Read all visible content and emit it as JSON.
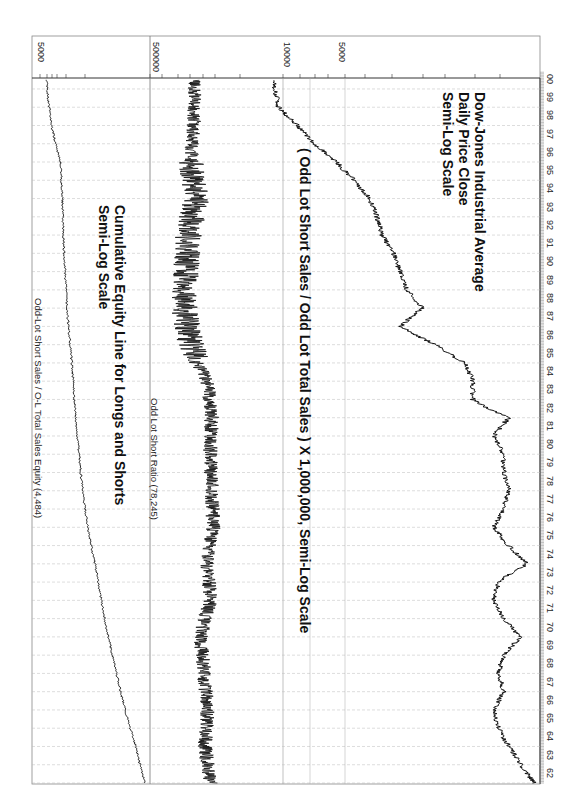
{
  "chart_data": [
    {
      "type": "line",
      "title": "Odd-Lot Short Sales / O-L Total Sales Equity (4,484)",
      "annotation": [
        "Cumulative Equity Line for Longs and Shorts",
        "Semi-Log Scale"
      ],
      "orientation": "rotated 90deg clockwise (time runs bottom-to-top)",
      "scale": "log",
      "tick_labels": [
        "5000"
      ],
      "x": [
        1962,
        1964,
        1966,
        1968,
        1970,
        1972,
        1974,
        1976,
        1978,
        1980,
        1982,
        1984,
        1986,
        1988,
        1990,
        1992,
        1994,
        1996,
        1998,
        2000
      ],
      "values": [
        1000,
        1150,
        1350,
        1550,
        1750,
        1950,
        2150,
        2400,
        2600,
        2750,
        2900,
        3000,
        3150,
        3300,
        3400,
        3500,
        3550,
        3650,
        4200,
        4484
      ],
      "grid": true
    },
    {
      "type": "line",
      "title": "Odd Lot Short Ratio (78,245)",
      "annotation": [
        "( Odd Lot Short Sales / Odd Lot Total Sales ) X 1,000,000, Semi-Log Scale"
      ],
      "scale": "log",
      "tick_labels": [
        "500000"
      ],
      "x": [
        1962,
        1964,
        1966,
        1968,
        1970,
        1972,
        1974,
        1976,
        1978,
        1980,
        1982,
        1984,
        1986,
        1988,
        1990,
        1992,
        1994,
        1996,
        1998,
        2000
      ],
      "values": [
        40000,
        50000,
        45000,
        52000,
        60000,
        40000,
        45000,
        35000,
        38000,
        40000,
        38000,
        45000,
        90000,
        120000,
        110000,
        100000,
        70000,
        90000,
        80000,
        78245
      ],
      "grid": true
    },
    {
      "type": "line",
      "title": "Dow-Jones Industrial Average",
      "annotation": [
        "Dow-Jones Industrial Average",
        "Daily Price Close",
        "Semi-Log Scale"
      ],
      "scale": "log",
      "tick_labels": [
        "10000",
        "5000"
      ],
      "x": [
        1962,
        1963,
        1964,
        1965,
        1966,
        1967,
        1968,
        1969,
        1970,
        1971,
        1972,
        1973,
        1974,
        1975,
        1976,
        1977,
        1978,
        1979,
        1980,
        1981,
        1982,
        1983,
        1984,
        1985,
        1986,
        1987,
        1988,
        1989,
        1990,
        1991,
        1992,
        1993,
        1994,
        1995,
        1996,
        1997,
        1998,
        1999,
        2000
      ],
      "values": [
        600,
        700,
        800,
        900,
        950,
        850,
        900,
        850,
        700,
        850,
        950,
        900,
        650,
        800,
        950,
        850,
        800,
        850,
        850,
        950,
        800,
        1200,
        1200,
        1300,
        1800,
        2700,
        2100,
        2500,
        2700,
        2900,
        3300,
        3500,
        3800,
        4500,
        5500,
        7000,
        8500,
        10500,
        11000
      ],
      "grid": true
    }
  ],
  "axes": {
    "years": [
      "62",
      "63",
      "64",
      "65",
      "66",
      "67",
      "68",
      "69",
      "70",
      "71",
      "72",
      "73",
      "74",
      "75",
      "76",
      "77",
      "78",
      "79",
      "80",
      "81",
      "82",
      "83",
      "84",
      "85",
      "86",
      "87",
      "88",
      "89",
      "90",
      "91",
      "92",
      "93",
      "94",
      "95",
      "96",
      "97",
      "98",
      "99",
      "00"
    ],
    "value_ticks": {
      "equity": "5000",
      "ratio": "500000",
      "djia_high": "10000",
      "djia_low": "5000"
    }
  },
  "titles": {
    "equity_panel": "Odd-Lot Short Sales / O-L Total Sales Equity (4,484)",
    "ratio_panel": "Odd Lot Short Ratio (78,245)"
  },
  "annotations": {
    "equity_line1": "Cumulative Equity Line for Longs and Shorts",
    "equity_line2": "Semi-Log Scale",
    "ratio_line1": "( Odd Lot Short Sales / Odd Lot Total Sales )  X  1,000,000, Semi-Log Scale",
    "djia_line1": "Dow-Jones Industrial Average",
    "djia_line2": "Daily Price Close",
    "djia_line3": "Semi-Log Scale"
  }
}
